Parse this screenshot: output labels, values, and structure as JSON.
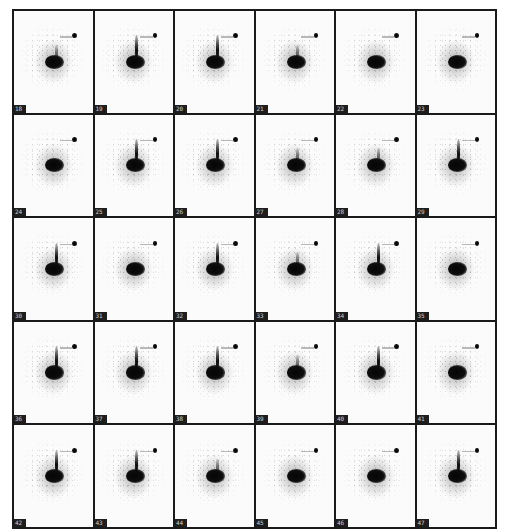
{
  "figure": {
    "type": "image-frame-grid",
    "rows": 5,
    "columns": 6,
    "frames": [
      {
        "label": "18",
        "stalk": "small"
      },
      {
        "label": "19",
        "stalk": "yes"
      },
      {
        "label": "20",
        "stalk": "yes"
      },
      {
        "label": "21",
        "stalk": "small"
      },
      {
        "label": "22",
        "stalk": "no"
      },
      {
        "label": "23",
        "stalk": "no"
      },
      {
        "label": "24",
        "stalk": "no"
      },
      {
        "label": "25",
        "stalk": "yes"
      },
      {
        "label": "26",
        "stalk": "yes"
      },
      {
        "label": "27",
        "stalk": "small"
      },
      {
        "label": "28",
        "stalk": "small"
      },
      {
        "label": "29",
        "stalk": "yes"
      },
      {
        "label": "30",
        "stalk": "yes"
      },
      {
        "label": "31",
        "stalk": "no"
      },
      {
        "label": "32",
        "stalk": "yes"
      },
      {
        "label": "33",
        "stalk": "small"
      },
      {
        "label": "34",
        "stalk": "yes"
      },
      {
        "label": "35",
        "stalk": "no"
      },
      {
        "label": "36",
        "stalk": "yes"
      },
      {
        "label": "37",
        "stalk": "yes"
      },
      {
        "label": "38",
        "stalk": "yes"
      },
      {
        "label": "39",
        "stalk": "small"
      },
      {
        "label": "40",
        "stalk": "yes"
      },
      {
        "label": "41",
        "stalk": "no"
      },
      {
        "label": "42",
        "stalk": "yes"
      },
      {
        "label": "43",
        "stalk": "yes"
      },
      {
        "label": "44",
        "stalk": "small"
      },
      {
        "label": "45",
        "stalk": "no"
      },
      {
        "label": "46",
        "stalk": "no"
      },
      {
        "label": "47",
        "stalk": "yes"
      }
    ]
  },
  "colors": {
    "background": "#ffffff",
    "grid_lines": "#1a1a1a",
    "frame_background": "#fbfbfb",
    "uptake": "#050505",
    "label_box": "#1e1e1e"
  }
}
